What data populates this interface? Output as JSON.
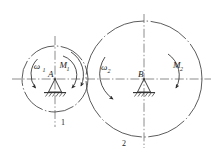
{
  "figure": {
    "title": "",
    "background_color": "#ffffff",
    "line_color": "#3a3a3a",
    "centerline_color": "#6e6e6e",
    "text_color": "#1a1a1a"
  },
  "bodies": [
    {
      "id": "body-1",
      "number_label": "1",
      "center_label": "A",
      "support_type": "pin-support",
      "center": {
        "x": 55,
        "y": 79
      },
      "radius": 33,
      "angular_velocity_label": "ω",
      "angular_velocity_subscript": "1",
      "moment_label": "M",
      "moment_subscript": "1",
      "rotation_sense": "clockwise"
    },
    {
      "id": "body-2",
      "number_label": "2",
      "center_label": "B",
      "support_type": "pin-support",
      "center": {
        "x": 144,
        "y": 79
      },
      "radius": 58,
      "angular_velocity_label": "ω",
      "angular_velocity_subscript": "2",
      "moment_label": "M",
      "moment_subscript": "2",
      "rotation_sense": "clockwise"
    }
  ],
  "axes": {
    "horizontal_centerline": {
      "x1": 12,
      "x2": 211,
      "y": 79,
      "style": "dash-dot"
    },
    "vertical_centerline_1": {
      "x": 55,
      "y1": 36,
      "y2": 127,
      "style": "dash-dot"
    },
    "vertical_centerline_2": {
      "x": 144,
      "y1": 14,
      "y2": 148,
      "style": "dash-dot"
    }
  },
  "annotations": {
    "omega1_text": "ω",
    "omega1_sub": "1",
    "m1_text": "M",
    "m1_sub": "1",
    "omega2_text": "ω",
    "omega2_sub": "2",
    "m2_text": "M",
    "m2_sub": "2",
    "point_a": "A",
    "point_b": "B",
    "label_one": "1",
    "label_two": "2"
  }
}
